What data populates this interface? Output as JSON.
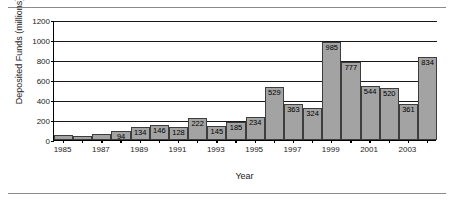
{
  "chart_data": {
    "type": "bar",
    "title": "",
    "xlabel": "Year",
    "ylabel": "Deposited Funds (millions)",
    "ylim": [
      0,
      1200
    ],
    "yticks": [
      0,
      200,
      400,
      600,
      800,
      1000,
      1200
    ],
    "ytick_labels": [
      "0",
      "200",
      "400",
      "600",
      "800",
      "1000",
      "1200"
    ],
    "grid": true,
    "legend": "none",
    "categories": [
      "1985",
      "1986",
      "1987",
      "1988",
      "1989",
      "1990",
      "1991",
      "1992",
      "1993",
      "1994",
      "1995",
      "1996",
      "1997",
      "1998",
      "1999",
      "2000",
      "2001",
      "2002",
      "2003",
      "2004"
    ],
    "xtick_labels": [
      "1985",
      "",
      "1987",
      "",
      "1989",
      "",
      "1991",
      "",
      "1993",
      "",
      "1995",
      "",
      "1997",
      "",
      "1999",
      "",
      "2001",
      "",
      "2003",
      ""
    ],
    "values": [
      50,
      45,
      65,
      94,
      134,
      146,
      128,
      222,
      145,
      185,
      234,
      529,
      363,
      324,
      985,
      777,
      544,
      520,
      361,
      834
    ],
    "value_labels": [
      "",
      "",
      "",
      "94",
      "134",
      "146",
      "128",
      "222",
      "145",
      "185",
      "234",
      "529",
      "363",
      "324",
      "985",
      "777",
      "544",
      "520",
      "361",
      "834"
    ],
    "bar_color": "#a3a3a3",
    "bar_edge_color": "#3d3d3d",
    "axis_color": "#000000"
  }
}
